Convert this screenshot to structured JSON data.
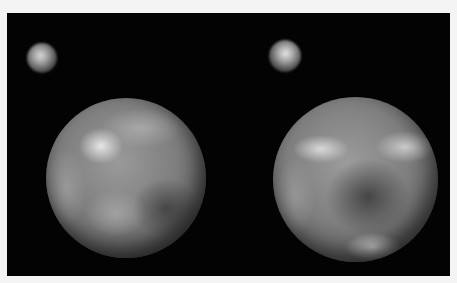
{
  "image": {
    "description": "Two side-by-side grayscale telescope views of a dwarf planet with its small moon, on black background",
    "panels": [
      {
        "name": "left-view",
        "planet": "large mottled sphere with bright upper-left spot",
        "moon": "small fuzzy sphere upper-left"
      },
      {
        "name": "right-view",
        "planet": "large mottled sphere with bright bands and dark center",
        "moon": "small fuzzy sphere upper-left"
      }
    ],
    "colors": {
      "background": "#030303",
      "border": "#f4f4f4"
    }
  }
}
